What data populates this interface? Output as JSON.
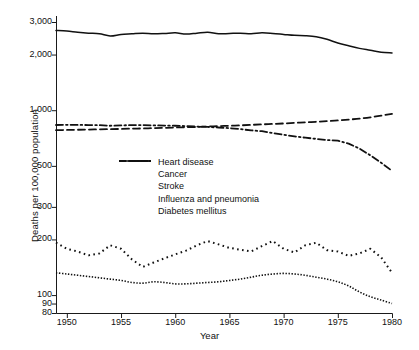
{
  "chart_data": {
    "type": "line",
    "title": "",
    "xlabel": "Year",
    "ylabel": "Deaths per 100,000 population",
    "yscale": "log",
    "ylim": [
      80,
      3400
    ],
    "xlim": [
      1949,
      1980
    ],
    "grid": false,
    "legend_position": "inside-center-left",
    "ytick_labels": [
      "3,000",
      "2,000",
      "1,000",
      "500",
      "300",
      "200",
      "100",
      "90",
      "80"
    ],
    "ytick_values": [
      3000,
      2000,
      1000,
      500,
      300,
      200,
      100,
      90,
      80
    ],
    "xtick_labels": [
      "1950",
      "1955",
      "1960",
      "1965",
      "1970",
      "1975",
      "1980"
    ],
    "xtick_values": [
      1950,
      1955,
      1960,
      1965,
      1970,
      1975,
      1980
    ],
    "x": [
      1949,
      1950,
      1951,
      1952,
      1953,
      1954,
      1955,
      1956,
      1957,
      1958,
      1959,
      1960,
      1961,
      1962,
      1963,
      1964,
      1965,
      1966,
      1967,
      1968,
      1969,
      1970,
      1971,
      1972,
      1973,
      1974,
      1975,
      1976,
      1977,
      1978,
      1979,
      1980
    ],
    "series": [
      {
        "name": "Heart disease",
        "style": "solid",
        "values": [
          2700,
          2680,
          2640,
          2610,
          2590,
          2520,
          2570,
          2590,
          2610,
          2590,
          2600,
          2620,
          2580,
          2610,
          2640,
          2590,
          2600,
          2610,
          2590,
          2620,
          2600,
          2570,
          2540,
          2530,
          2500,
          2420,
          2310,
          2230,
          2160,
          2110,
          2060,
          2040
        ]
      },
      {
        "name": "Cancer",
        "style": "dashed",
        "values": [
          780,
          782,
          784,
          786,
          788,
          790,
          792,
          795,
          797,
          800,
          803,
          806,
          809,
          812,
          816,
          820,
          824,
          828,
          833,
          838,
          843,
          848,
          854,
          860,
          866,
          873,
          880,
          890,
          900,
          915,
          935,
          955
        ]
      },
      {
        "name": "Stroke",
        "style": "dashdot",
        "values": [
          832,
          834,
          833,
          831,
          830,
          824,
          828,
          830,
          831,
          828,
          826,
          824,
          820,
          816,
          812,
          806,
          800,
          790,
          778,
          770,
          752,
          736,
          722,
          710,
          700,
          690,
          684,
          660,
          620,
          570,
          520,
          470
        ]
      },
      {
        "name": "Influenza and pneumonia",
        "style": "dotted-wide",
        "values": [
          192,
          178,
          172,
          164,
          168,
          186,
          178,
          156,
          142,
          150,
          158,
          166,
          174,
          186,
          196,
          188,
          180,
          176,
          172,
          184,
          196,
          178,
          170,
          186,
          192,
          175,
          172,
          163,
          168,
          178,
          160,
          132
        ]
      },
      {
        "name": "Diabetes mellitus",
        "style": "dotted-fine",
        "values": [
          132,
          130,
          128,
          126,
          124,
          122,
          120,
          117,
          116,
          118,
          117,
          115,
          115,
          116,
          117,
          118,
          120,
          122,
          125,
          128,
          130,
          131,
          130,
          128,
          125,
          122,
          118,
          112,
          104,
          98,
          94,
          90
        ]
      }
    ]
  }
}
